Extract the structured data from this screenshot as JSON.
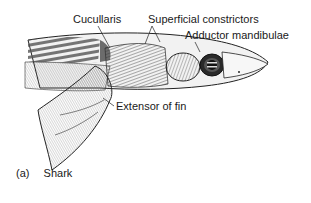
{
  "figure": {
    "caption_letter": "(a)",
    "caption_text": "Shark",
    "labels": {
      "cucullaris": "Cucullaris",
      "superficial_constrictors": "Superficial constrictors",
      "adductor_mandibulae": "Adductor mandibulae",
      "extensor_of_fin": "Extensor of fin"
    }
  }
}
